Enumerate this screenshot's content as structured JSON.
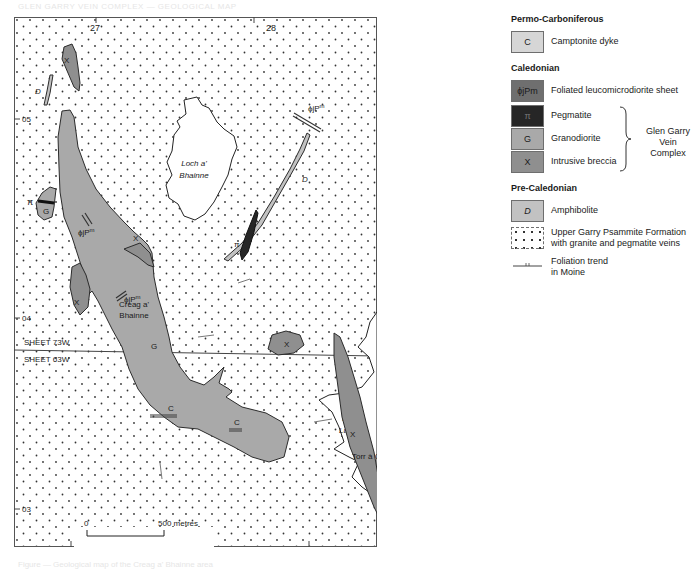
{
  "page": {
    "header_text": "GLEN GARRY VEIN COMPLEX — GEOLOGICAL MAP",
    "caption_text": "Figure — Geological map of the Creag a' Bhainne area"
  },
  "map": {
    "sheet_label": "NH",
    "grid_eastings": [
      "27",
      "28",
      "29"
    ],
    "grid_northings": [
      "05",
      "04",
      "03"
    ],
    "sheet_boundary": {
      "upper": "SHEET 73W",
      "lower": "SHEET 63W"
    },
    "north_label": "N",
    "scale_bar": {
      "start": "0",
      "end": "500 metres"
    },
    "place_names": {
      "loch_a_bhainne_1": "Loch a'",
      "loch_a_bhainne_2": "Bhainne",
      "creag_1": "Creag a'",
      "creag_2": "Bhainne",
      "loch_lundie_1": "Loch",
      "loch_lundie_2": "Lundie",
      "torr": "Torr à Chait"
    },
    "unit_symbols": {
      "breccia": "X",
      "granodiorite": "G",
      "pegmatite": "π",
      "amphibolite": "D",
      "camptonite": "C",
      "sheet": "ϕjP",
      "sheet_sup": "m"
    },
    "colors": {
      "granodiorite_fill": "#a9a9a9",
      "breccia_fill": "#8f8f8f",
      "amphibolite_fill": "#c2c2c2",
      "pegmatite_fill": "#262626",
      "camptonite_fill": "#d6d6d6",
      "sheet_fill": "#6f6f6f",
      "outline": "#2b2b2b"
    }
  },
  "legend": {
    "sections": [
      {
        "heading": "Permo-Carboniferous",
        "items": [
          {
            "symbol": "C",
            "label": "Camptonite dyke"
          }
        ]
      },
      {
        "heading": "Caledonian",
        "items": [
          {
            "symbol": "ϕjPm",
            "label": "Foliated leucomicrodiorite sheet"
          },
          {
            "symbol": "π",
            "label": "Pegmatite"
          },
          {
            "symbol": "G",
            "label": "Granodiorite"
          },
          {
            "symbol": "X",
            "label": "Intrusive breccia"
          }
        ],
        "group_label_1": "Glen Garry Vein",
        "group_label_2": "Complex"
      },
      {
        "heading": "Pre-Caledonian",
        "items": [
          {
            "symbol": "D",
            "label": "Amphibolite"
          },
          {
            "symbol": "",
            "label_1": "Upper Garry Psammite Formation",
            "label_2": "with granite and pegmatite veins"
          },
          {
            "symbol": "",
            "label_1": "Foliation trend",
            "label_2": "in Moine"
          }
        ]
      }
    ]
  }
}
